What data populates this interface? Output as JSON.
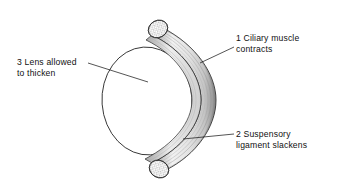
{
  "figure": {
    "background_color": "#ffffff",
    "ink_color": "#111111"
  },
  "labels": [
    {
      "id": "ciliary-muscle",
      "number": "1",
      "line1": "1 Ciliary muscle",
      "line2": "contracts",
      "leader": "from ciliary muscle band to text"
    },
    {
      "id": "suspensory-ligament",
      "number": "2",
      "line1": "2 Suspensory",
      "line2": "ligament slackens",
      "leader": "from inner edge of ciliary body to text"
    },
    {
      "id": "lens",
      "number": "3",
      "line1": "3 Lens allowed",
      "line2": "to thicken",
      "leader": "from text to centre of lens"
    }
  ],
  "diagram": {
    "parts": [
      {
        "name": "ciliary-muscle-band",
        "description": "crescent shaped ciliary muscle ring shown in perspective"
      },
      {
        "name": "ciliary-muscle-cut-end-top",
        "description": "stippled circular cut face at upper end of ring"
      },
      {
        "name": "ciliary-muscle-cut-end-bottom",
        "description": "stippled circular cut face at lower end of ring"
      },
      {
        "name": "lens",
        "description": "large oval lens seen obliquely"
      },
      {
        "name": "muscle-fibres",
        "description": "fine striations running along the muscle band"
      }
    ]
  }
}
